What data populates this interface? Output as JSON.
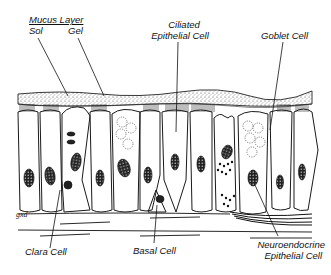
{
  "diagram": {
    "labels": {
      "mucus_layer": "Mucus Layer",
      "sol": "Sol",
      "gel": "Gel",
      "ciliated_line1": "Ciliated",
      "ciliated_line2": "Epithelial Cell",
      "goblet": "Goblet Cell",
      "clara": "Clara Cell",
      "basal": "Basal Cell",
      "neuro_line1": "Neuroendocrine",
      "neuro_line2": "Epithelial Cell"
    },
    "signature": "gxd",
    "colors": {
      "ink": "#111111",
      "background": "#ffffff",
      "stipple": "#555555"
    }
  }
}
